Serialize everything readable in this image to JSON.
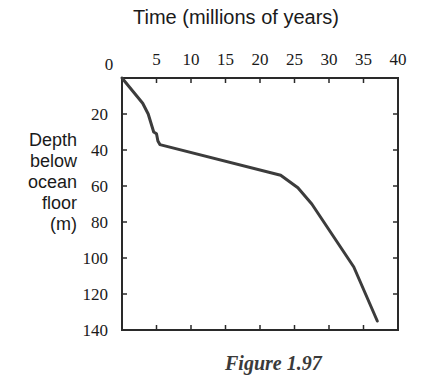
{
  "chart_data": {
    "type": "line",
    "title": "Time (millions of years)",
    "xlabel": "Time (millions of years)",
    "ylabel": "Depth below ocean floor (m)",
    "ylabel_lines": [
      "Depth",
      "below",
      "ocean",
      "floor",
      "(m)"
    ],
    "caption": "Figure 1.97",
    "x_axis_position": "top",
    "y_inverted": true,
    "xlim": [
      0,
      40
    ],
    "ylim": [
      0,
      140
    ],
    "x_ticks": [
      0,
      5,
      10,
      15,
      20,
      25,
      30,
      35,
      40
    ],
    "y_ticks": [
      20,
      40,
      60,
      80,
      100,
      120,
      140
    ],
    "grid": false,
    "series": [
      {
        "name": "Depth vs time",
        "color": "#3c3c3c",
        "x": [
          0,
          3.0,
          3.8,
          4.6,
          5.0,
          5.2,
          5.5,
          23.0,
          25.5,
          27.5,
          33.6,
          37.0
        ],
        "y": [
          0,
          14,
          20,
          30,
          31,
          35,
          37,
          54,
          61,
          70,
          105,
          135
        ]
      }
    ]
  }
}
